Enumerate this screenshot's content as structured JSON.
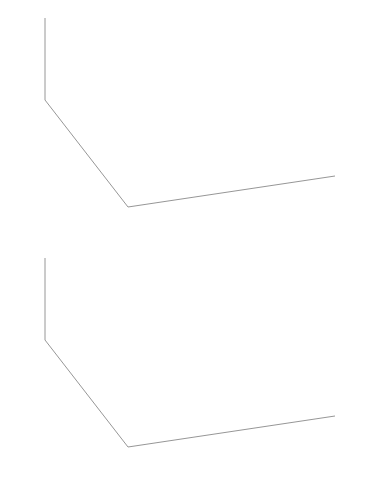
{
  "figure": {
    "title": "",
    "panels": [
      {
        "id": "top",
        "name": "pca-first-principal-component-3d-scatter",
        "description": "3D scatter of data points with first principal component line through the centroid"
      },
      {
        "id": "bottom",
        "name": "pca-principal-plane-3d-scatter",
        "description": "3D scatter of data points with fitted principal plane and projection residual lines"
      }
    ]
  },
  "axes": {
    "x1": {
      "label": "x",
      "sub": "1",
      "ticks": [
        "10",
        "5",
        "0",
        "-5",
        "-10"
      ],
      "values": [
        10,
        5,
        0,
        -5,
        -10
      ]
    },
    "x2": {
      "label": "x",
      "sub": "2",
      "ticks": [
        "-10",
        "-5",
        "0",
        "5",
        "10",
        "15"
      ],
      "values": [
        -10,
        -5,
        0,
        5,
        10,
        15
      ]
    },
    "x3": {
      "label": "x",
      "sub": "3",
      "ticks": [
        "10",
        "0",
        "-10"
      ],
      "values": [
        10,
        0,
        -10
      ]
    }
  },
  "chart_data": [
    {
      "type": "scatter",
      "panel": "top",
      "title": "",
      "xlabel": "x_1",
      "ylabel": "x_2",
      "zlabel": "x_3",
      "xlim": [
        -10,
        10
      ],
      "ylim": [
        -10,
        15
      ],
      "zlim": [
        -10,
        10
      ],
      "xticks": [
        10,
        5,
        0,
        -5,
        -10
      ],
      "yticks": [
        -10,
        -5,
        0,
        5,
        10,
        15
      ],
      "zticks": [
        -10,
        0,
        10
      ],
      "grid": false,
      "legend": "none",
      "marker": "x",
      "marker_color": "#6e6e6e",
      "annotations": [
        {
          "kind": "line",
          "name": "first-principal-component",
          "color": "#111111",
          "width": 3.1,
          "x": [
            89,
            288
          ],
          "y": [
            48,
            128
          ]
        },
        {
          "kind": "point",
          "name": "centroid",
          "color": "#111111",
          "x": 186,
          "y": 90,
          "r": 3.4
        }
      ],
      "points_px": [
        [
          112,
          70
        ],
        [
          118,
          84
        ],
        [
          124,
          57
        ],
        [
          132,
          77
        ],
        [
          136,
          64
        ],
        [
          140,
          88
        ],
        [
          141,
          53
        ],
        [
          145,
          71
        ],
        [
          148,
          95
        ],
        [
          150,
          60
        ],
        [
          153,
          80
        ],
        [
          155,
          47
        ],
        [
          158,
          68
        ],
        [
          160,
          86
        ],
        [
          162,
          56
        ],
        [
          165,
          75
        ],
        [
          167,
          92
        ],
        [
          169,
          62
        ],
        [
          171,
          50
        ],
        [
          173,
          83
        ],
        [
          175,
          70
        ],
        [
          177,
          58
        ],
        [
          179,
          97
        ],
        [
          181,
          77
        ],
        [
          183,
          65
        ],
        [
          185,
          88
        ],
        [
          187,
          54
        ],
        [
          189,
          72
        ],
        [
          191,
          81
        ],
        [
          193,
          60
        ],
        [
          195,
          93
        ],
        [
          197,
          68
        ],
        [
          199,
          76
        ],
        [
          201,
          51
        ],
        [
          203,
          85
        ],
        [
          205,
          63
        ],
        [
          207,
          90
        ],
        [
          209,
          71
        ],
        [
          211,
          57
        ],
        [
          213,
          79
        ],
        [
          215,
          66
        ],
        [
          217,
          95
        ],
        [
          219,
          74
        ],
        [
          221,
          59
        ],
        [
          223,
          84
        ],
        [
          225,
          69
        ],
        [
          227,
          88
        ],
        [
          229,
          77
        ],
        [
          231,
          62
        ],
        [
          233,
          91
        ],
        [
          235,
          72
        ],
        [
          237,
          80
        ],
        [
          239,
          66
        ],
        [
          241,
          86
        ],
        [
          243,
          74
        ],
        [
          245,
          95
        ],
        [
          247,
          68
        ],
        [
          249,
          82
        ],
        [
          251,
          59
        ],
        [
          253,
          90
        ],
        [
          255,
          76
        ],
        [
          258,
          70
        ],
        [
          261,
          85
        ],
        [
          264,
          64
        ],
        [
          267,
          93
        ],
        [
          270,
          78
        ],
        [
          273,
          72
        ],
        [
          276,
          88
        ],
        [
          279,
          66
        ],
        [
          282,
          96
        ],
        [
          100,
          92
        ],
        [
          106,
          107
        ],
        [
          113,
          118
        ],
        [
          120,
          100
        ],
        [
          127,
          113
        ],
        [
          134,
          104
        ],
        [
          119,
          128
        ],
        [
          126,
          136
        ],
        [
          143,
          111
        ],
        [
          150,
          122
        ],
        [
          157,
          132
        ],
        [
          164,
          115
        ],
        [
          171,
          126
        ],
        [
          178,
          108
        ],
        [
          185,
          119
        ],
        [
          152,
          144
        ],
        [
          166,
          150
        ],
        [
          192,
          130
        ],
        [
          199,
          118
        ],
        [
          206,
          127
        ],
        [
          213,
          138
        ],
        [
          220,
          121
        ],
        [
          227,
          133
        ],
        [
          234,
          112
        ],
        [
          241,
          124
        ],
        [
          248,
          135
        ],
        [
          255,
          117
        ],
        [
          262,
          129
        ],
        [
          269,
          120
        ],
        [
          276,
          113
        ],
        [
          283,
          124
        ],
        [
          290,
          110
        ],
        [
          296,
          119
        ],
        [
          143,
          87
        ],
        [
          161,
          98
        ],
        [
          203,
          102
        ]
      ]
    },
    {
      "type": "scatter",
      "panel": "bottom",
      "title": "",
      "xlabel": "x_1",
      "ylabel": "x_2",
      "zlabel": "x_3",
      "xlim": [
        -10,
        10
      ],
      "ylim": [
        -10,
        15
      ],
      "zlim": [
        -10,
        10
      ],
      "xticks": [
        10,
        5,
        0,
        -5,
        -10
      ],
      "yticks": [
        -10,
        -5,
        0,
        5,
        10,
        15
      ],
      "zticks": [
        -10,
        0,
        10
      ],
      "grid": false,
      "legend": "none",
      "marker": "x",
      "marker_color": "#5d5d5d",
      "plane_px": [
        [
          77,
          268
        ],
        [
          293,
          325
        ],
        [
          297,
          425
        ],
        [
          83,
          343
        ]
      ],
      "plane_color": "#b9b9b9",
      "points_px": [
        [
          147,
          294
        ],
        [
          160,
          300
        ],
        [
          172,
          289
        ],
        [
          183,
          305
        ],
        [
          194,
          296
        ],
        [
          205,
          310
        ],
        [
          216,
          299
        ],
        [
          227,
          313
        ],
        [
          238,
          303
        ],
        [
          249,
          317
        ],
        [
          118,
          314
        ],
        [
          129,
          322
        ],
        [
          140,
          311
        ],
        [
          151,
          327
        ],
        [
          162,
          316
        ],
        [
          173,
          331
        ],
        [
          184,
          320
        ],
        [
          195,
          335
        ],
        [
          206,
          324
        ],
        [
          217,
          339
        ],
        [
          133,
          333
        ],
        [
          144,
          341
        ],
        [
          155,
          330
        ],
        [
          166,
          346
        ],
        [
          177,
          335
        ],
        [
          188,
          350
        ],
        [
          199,
          339
        ],
        [
          210,
          354
        ],
        [
          221,
          343
        ],
        [
          232,
          357
        ],
        [
          110,
          343
        ],
        [
          122,
          352
        ],
        [
          109,
          363
        ],
        [
          121,
          371
        ],
        [
          155,
          370
        ],
        [
          168,
          362
        ],
        [
          181,
          374
        ],
        [
          193,
          366
        ],
        [
          206,
          378
        ],
        [
          219,
          370
        ],
        [
          95,
          352
        ],
        [
          106,
          361
        ],
        [
          136,
          380
        ],
        [
          149,
          388
        ],
        [
          163,
          395
        ],
        [
          176,
          387
        ],
        [
          231,
          381
        ],
        [
          244,
          374
        ],
        [
          257,
          386
        ],
        [
          270,
          378
        ],
        [
          200,
          393
        ],
        [
          212,
          401
        ],
        [
          163,
          416
        ],
        [
          176,
          423
        ],
        [
          90,
          382
        ],
        [
          102,
          390
        ],
        [
          231,
          348
        ],
        [
          243,
          356
        ],
        [
          255,
          345
        ],
        [
          266,
          353
        ],
        [
          278,
          342
        ],
        [
          289,
          350
        ],
        [
          262,
          367
        ],
        [
          274,
          361
        ],
        [
          286,
          372
        ],
        [
          151,
          354
        ],
        [
          164,
          348
        ],
        [
          177,
          359
        ],
        [
          190,
          352
        ],
        [
          203,
          363
        ],
        [
          215,
          357
        ],
        [
          228,
          368
        ],
        [
          240,
          362
        ],
        [
          141,
          363
        ],
        [
          128,
          358
        ],
        [
          116,
          334
        ],
        [
          104,
          329
        ],
        [
          98,
          340
        ],
        [
          259,
          329
        ],
        [
          271,
          336
        ],
        [
          283,
          327
        ],
        [
          246,
          336
        ],
        [
          234,
          328
        ],
        [
          222,
          333
        ],
        [
          210,
          327
        ],
        [
          198,
          332
        ],
        [
          186,
          326
        ],
        [
          174,
          330
        ],
        [
          162,
          325
        ],
        [
          150,
          329
        ],
        [
          138,
          323
        ],
        [
          126,
          328
        ]
      ],
      "projection_lines_px": [
        [
          [
            109,
            363
          ],
          [
            152,
            345
          ]
        ],
        [
          [
            121,
            371
          ],
          [
            164,
            352
          ]
        ],
        [
          [
            136,
            380
          ],
          [
            179,
            361
          ]
        ],
        [
          [
            149,
            388
          ],
          [
            192,
            369
          ]
        ],
        [
          [
            163,
            416
          ],
          [
            206,
            397
          ]
        ],
        [
          [
            176,
            423
          ],
          [
            219,
            404
          ]
        ],
        [
          [
            95,
            352
          ],
          [
            138,
            334
          ]
        ],
        [
          [
            106,
            361
          ],
          [
            149,
            342
          ]
        ],
        [
          [
            231,
            381
          ],
          [
            274,
            362
          ]
        ],
        [
          [
            244,
            374
          ],
          [
            287,
            355
          ]
        ],
        [
          [
            110,
            343
          ],
          [
            153,
            324
          ]
        ],
        [
          [
            122,
            352
          ],
          [
            165,
            333
          ]
        ],
        [
          [
            200,
            393
          ],
          [
            243,
            374
          ]
        ],
        [
          [
            133,
            333
          ],
          [
            176,
            315
          ]
        ],
        [
          [
            144,
            341
          ],
          [
            187,
            322
          ]
        ],
        [
          [
            155,
            330
          ],
          [
            198,
            312
          ]
        ],
        [
          [
            166,
            346
          ],
          [
            209,
            327
          ]
        ],
        [
          [
            177,
            335
          ],
          [
            220,
            316
          ]
        ],
        [
          [
            118,
            314
          ],
          [
            161,
            296
          ]
        ],
        [
          [
            129,
            322
          ],
          [
            172,
            303
          ]
        ],
        [
          [
            140,
            311
          ],
          [
            183,
            293
          ]
        ],
        [
          [
            151,
            327
          ],
          [
            194,
            308
          ]
        ],
        [
          [
            162,
            316
          ],
          [
            205,
            297
          ]
        ],
        [
          [
            173,
            331
          ],
          [
            216,
            312
          ]
        ],
        [
          [
            184,
            320
          ],
          [
            227,
            301
          ]
        ],
        [
          [
            195,
            335
          ],
          [
            238,
            316
          ]
        ],
        [
          [
            206,
            324
          ],
          [
            249,
            305
          ]
        ],
        [
          [
            217,
            339
          ],
          [
            260,
            320
          ]
        ],
        [
          [
            188,
            350
          ],
          [
            231,
            331
          ]
        ],
        [
          [
            199,
            339
          ],
          [
            242,
            320
          ]
        ],
        [
          [
            210,
            354
          ],
          [
            253,
            335
          ]
        ],
        [
          [
            221,
            343
          ],
          [
            264,
            324
          ]
        ],
        [
          [
            232,
            357
          ],
          [
            275,
            338
          ]
        ],
        [
          [
            155,
            370
          ],
          [
            198,
            351
          ]
        ],
        [
          [
            168,
            362
          ],
          [
            211,
            343
          ]
        ],
        [
          [
            181,
            374
          ],
          [
            224,
            355
          ]
        ],
        [
          [
            193,
            366
          ],
          [
            236,
            347
          ]
        ],
        [
          [
            219,
            370
          ],
          [
            262,
            351
          ]
        ],
        [
          [
            257,
            386
          ],
          [
            300,
            367
          ]
        ],
        [
          [
            270,
            378
          ],
          [
            313,
            359
          ]
        ]
      ]
    }
  ]
}
